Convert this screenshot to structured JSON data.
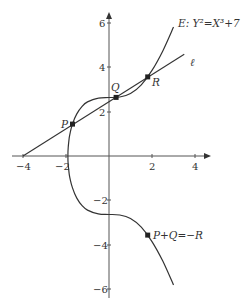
{
  "chart_data": {
    "type": "line",
    "title": "",
    "xlabel": "",
    "ylabel": "",
    "xlim": [
      -4.2,
      4.6
    ],
    "ylim": [
      -6.1,
      6.3
    ],
    "grid": false,
    "x_ticks": [
      -4,
      -2,
      2,
      4
    ],
    "y_ticks": [
      6,
      4,
      2,
      -2,
      -4,
      -6
    ],
    "x_tick_labels": [
      "−4",
      "−2",
      "2",
      "4"
    ],
    "y_tick_labels": [
      "6",
      "4",
      "2",
      "−2",
      "−4",
      "−6"
    ],
    "series": [
      {
        "name": "E: Y²=X³+7",
        "kind": "curve",
        "x": [
          -1.913,
          -1.9,
          -1.85,
          -1.8,
          -1.7,
          -1.5,
          -1.25,
          -1.0,
          -0.5,
          0.0,
          0.5,
          1.0,
          1.5,
          2.0,
          2.5,
          3.0
        ],
        "y_upper": [
          0,
          0.375,
          0.817,
          1.081,
          1.445,
          1.904,
          2.247,
          2.449,
          2.622,
          2.646,
          2.669,
          2.828,
          3.221,
          3.873,
          4.757,
          5.831
        ]
      },
      {
        "name": "ℓ",
        "kind": "line",
        "x": [
          -4.0,
          3.5
        ],
        "y": [
          0.0,
          4.6
        ]
      }
    ],
    "points": [
      {
        "label": "P",
        "x": -1.7,
        "y": 1.445
      },
      {
        "label": "Q",
        "x": 0.33,
        "y": 2.65
      },
      {
        "label": "R",
        "x": 1.8,
        "y": 3.58
      },
      {
        "label": "P+Q=−R",
        "x": 1.8,
        "y": -3.58
      }
    ]
  },
  "labels": {
    "curve": "E: Y²=X³+7",
    "line": "ℓ",
    "P": "P",
    "Q": "Q",
    "R": "R",
    "negR": "P+Q=−R"
  },
  "ticks": {
    "x_m4": "−4",
    "x_m2": "−2",
    "x_2": "2",
    "x_4": "4",
    "y_6": "6",
    "y_4": "4",
    "y_2": "2",
    "y_m2": "−2",
    "y_m4": "−4",
    "y_m6": "−6"
  }
}
